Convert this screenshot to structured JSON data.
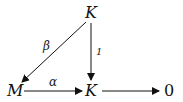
{
  "diagram": {
    "nodes": [
      {
        "id": "K_top",
        "label": "K"
      },
      {
        "id": "M",
        "label": "M"
      },
      {
        "id": "K_bottom",
        "label": "K"
      },
      {
        "id": "zero",
        "label": "0"
      }
    ],
    "edges": [
      {
        "from": "K_top",
        "to": "M",
        "label": "β"
      },
      {
        "from": "K_top",
        "to": "K_bottom",
        "label": "1"
      },
      {
        "from": "M",
        "to": "K_bottom",
        "label": "α"
      },
      {
        "from": "K_bottom",
        "to": "zero",
        "label": ""
      }
    ]
  }
}
